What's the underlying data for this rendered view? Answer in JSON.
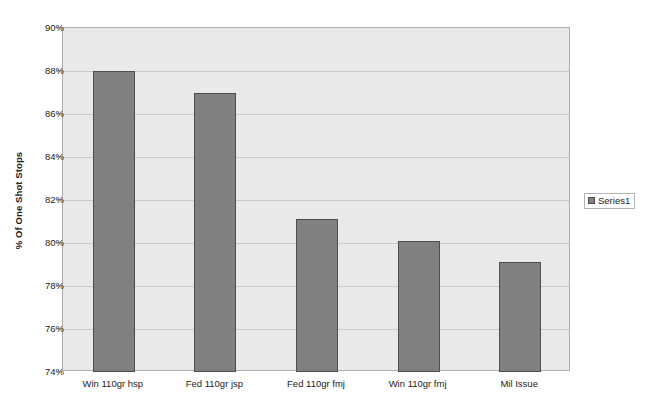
{
  "chart_data": {
    "type": "bar",
    "title": "",
    "subtitle": "",
    "xlabel": "",
    "ylabel": "% Of One Shot Stops",
    "categories": [
      "Win 110gr hsp",
      "Fed 110gr jsp",
      "Fed 110gr fmj",
      "Win 110gr fmj",
      "Mil Issue"
    ],
    "values": [
      88.0,
      87.0,
      81.1,
      80.1,
      79.1
    ],
    "series": [
      {
        "name": "Series1",
        "values": [
          88.0,
          87.0,
          81.1,
          80.1,
          79.1
        ]
      }
    ],
    "ylim": [
      74,
      90
    ],
    "ytick_step": 2,
    "ytick_labels": [
      "74%",
      "76%",
      "78%",
      "80%",
      "82%",
      "84%",
      "86%",
      "88%",
      "90%"
    ],
    "ytick_values": [
      74,
      76,
      78,
      80,
      82,
      84,
      86,
      88,
      90
    ],
    "grid": true,
    "grid_axis": "y",
    "legend_position": "right",
    "legend_entries": [
      "Series1"
    ],
    "colors": {
      "bar_fill": "#808080",
      "bar_border": "#4d4d4d",
      "plot_background": "#e9e9e9",
      "plot_border": "#adadad",
      "gridline": "#c9c9c9",
      "text": "#1b1b1b",
      "chart_background": "#ffffff"
    }
  },
  "legend": {
    "label": "Series1"
  }
}
